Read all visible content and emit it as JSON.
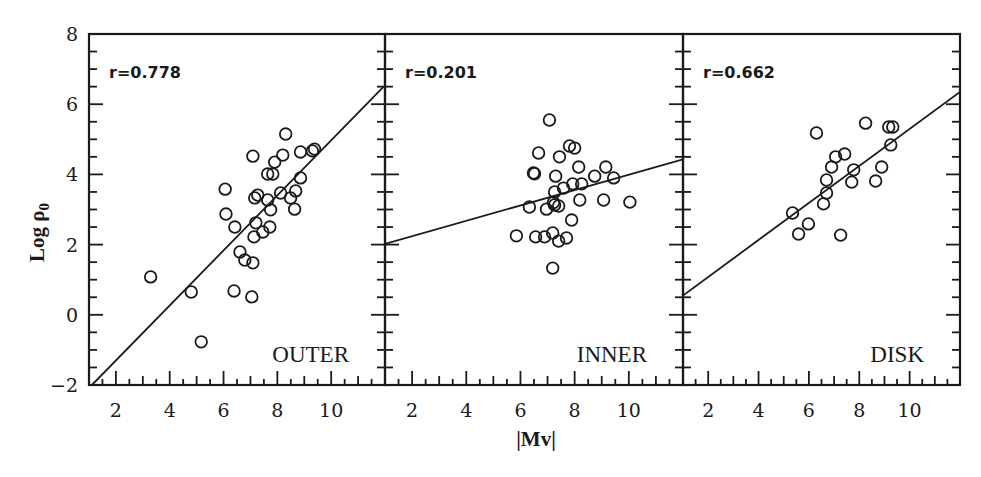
{
  "figure": {
    "ylabel": "Log ρ",
    "ylabel_sub": "0",
    "xlabel": "|Mv|"
  },
  "chart_data": [
    {
      "type": "scatter",
      "title": "OUTER",
      "annotation": "r=0.778",
      "xlabel": "|Mv|",
      "ylabel": "Log ρ0",
      "xlim": [
        1,
        12
      ],
      "ylim": [
        -2,
        8
      ],
      "xticks": [
        2,
        4,
        6,
        8,
        10
      ],
      "yticks": [
        -2,
        0,
        2,
        4,
        6,
        8
      ],
      "fit_line": {
        "x": [
          1.11,
          11.95
        ],
        "y": [
          -2.0,
          6.5
        ]
      },
      "points": [
        [
          3.29,
          1.08
        ],
        [
          4.8,
          0.65
        ],
        [
          5.17,
          -0.77
        ],
        [
          6.39,
          0.68
        ],
        [
          7.05,
          0.51
        ],
        [
          6.61,
          1.79
        ],
        [
          6.79,
          1.56
        ],
        [
          7.09,
          1.48
        ],
        [
          6.09,
          2.87
        ],
        [
          6.42,
          2.5
        ],
        [
          7.13,
          2.22
        ],
        [
          7.46,
          2.36
        ],
        [
          7.2,
          2.62
        ],
        [
          7.72,
          2.5
        ],
        [
          6.06,
          3.58
        ],
        [
          7.16,
          3.33
        ],
        [
          7.27,
          3.41
        ],
        [
          7.64,
          3.27
        ],
        [
          7.75,
          2.99
        ],
        [
          8.12,
          3.47
        ],
        [
          8.49,
          3.33
        ],
        [
          8.68,
          3.53
        ],
        [
          8.64,
          3.01
        ],
        [
          8.86,
          3.9
        ],
        [
          7.64,
          4.01
        ],
        [
          7.83,
          4.01
        ],
        [
          7.9,
          4.35
        ],
        [
          7.09,
          4.52
        ],
        [
          8.2,
          4.55
        ],
        [
          8.31,
          5.15
        ],
        [
          8.86,
          4.64
        ],
        [
          9.3,
          4.67
        ],
        [
          9.38,
          4.72
        ]
      ]
    },
    {
      "type": "scatter",
      "title": "INNER",
      "annotation": "r=0.201",
      "xlabel": "|Mv|",
      "ylabel": "Log ρ0",
      "xlim": [
        1,
        12
      ],
      "ylim": [
        -2,
        8
      ],
      "xticks": [
        2,
        4,
        6,
        8,
        10
      ],
      "yticks": [
        -2,
        0,
        2,
        4,
        6,
        8
      ],
      "fit_line": {
        "x": [
          1.0,
          12.0
        ],
        "y": [
          2.02,
          4.43
        ]
      },
      "points": [
        [
          7.07,
          5.55
        ],
        [
          6.67,
          4.61
        ],
        [
          7.44,
          4.5
        ],
        [
          7.81,
          4.81
        ],
        [
          8.0,
          4.75
        ],
        [
          8.15,
          4.21
        ],
        [
          6.48,
          4.04
        ],
        [
          6.52,
          4.02
        ],
        [
          7.3,
          3.95
        ],
        [
          8.74,
          3.95
        ],
        [
          9.15,
          4.21
        ],
        [
          9.44,
          3.9
        ],
        [
          7.93,
          3.73
        ],
        [
          8.26,
          3.73
        ],
        [
          7.59,
          3.61
        ],
        [
          7.26,
          3.5
        ],
        [
          7.26,
          3.13
        ],
        [
          7.41,
          3.1
        ],
        [
          7.22,
          3.2
        ],
        [
          8.19,
          3.27
        ],
        [
          9.07,
          3.27
        ],
        [
          10.04,
          3.21
        ],
        [
          6.33,
          3.07
        ],
        [
          6.96,
          3.01
        ],
        [
          7.89,
          2.7
        ],
        [
          5.85,
          2.25
        ],
        [
          6.56,
          2.22
        ],
        [
          6.89,
          2.22
        ],
        [
          7.19,
          2.33
        ],
        [
          7.41,
          2.1
        ],
        [
          7.7,
          2.19
        ],
        [
          7.19,
          1.33
        ]
      ]
    },
    {
      "type": "scatter",
      "title": "DISK",
      "annotation": "r=0.662",
      "xlabel": "|Mv|",
      "ylabel": "Log ρ0",
      "xlim": [
        1,
        12
      ],
      "ylim": [
        -2,
        8
      ],
      "xticks": [
        2,
        4,
        6,
        8,
        10
      ],
      "yticks": [
        -2,
        0,
        2,
        4,
        6,
        8
      ],
      "fit_line": {
        "x": [
          1.0,
          12.0
        ],
        "y": [
          0.55,
          6.35
        ]
      },
      "points": [
        [
          6.3,
          5.18
        ],
        [
          8.25,
          5.46
        ],
        [
          9.17,
          5.35
        ],
        [
          9.33,
          5.35
        ],
        [
          9.25,
          4.84
        ],
        [
          7.06,
          4.5
        ],
        [
          7.42,
          4.58
        ],
        [
          6.9,
          4.21
        ],
        [
          7.78,
          4.13
        ],
        [
          8.89,
          4.21
        ],
        [
          6.7,
          3.84
        ],
        [
          7.7,
          3.78
        ],
        [
          8.65,
          3.81
        ],
        [
          6.7,
          3.47
        ],
        [
          6.58,
          3.16
        ],
        [
          5.35,
          2.9
        ],
        [
          5.98,
          2.59
        ],
        [
          5.59,
          2.3
        ],
        [
          7.26,
          2.27
        ]
      ]
    }
  ]
}
